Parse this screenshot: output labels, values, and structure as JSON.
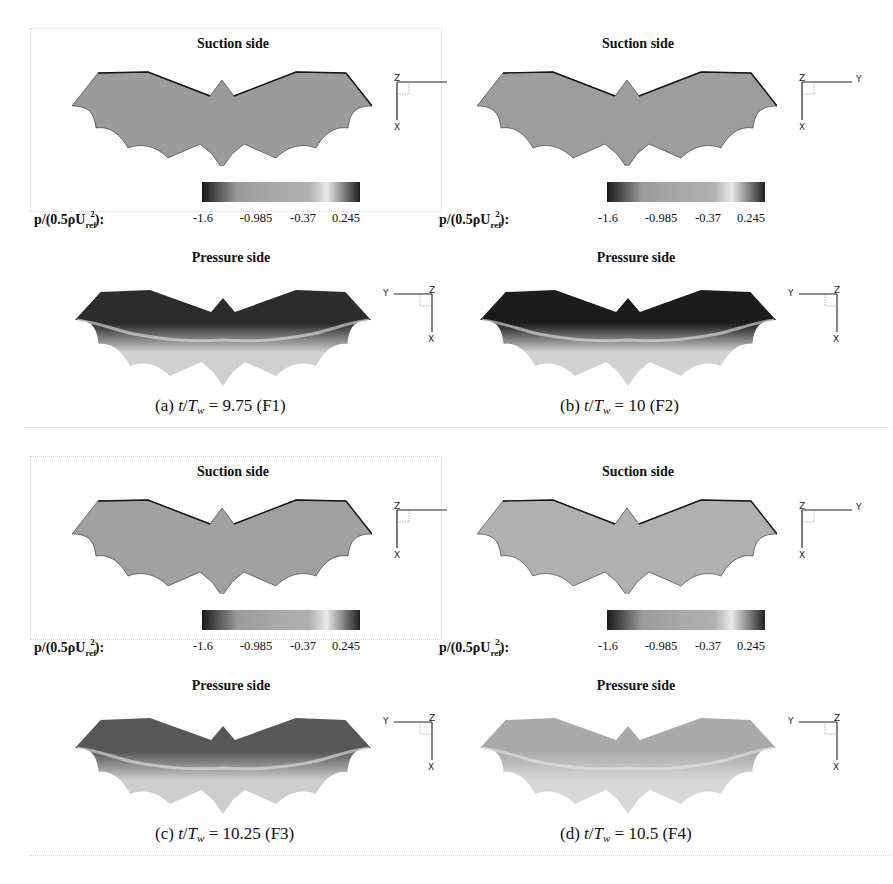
{
  "figure": {
    "colorbar": {
      "quantity_label": "p/(0.5ρU",
      "sub": "ref",
      "sup": "2",
      "suffix": "):",
      "ticks": [
        "-1.6",
        "-0.985",
        "-0.37",
        "0.245"
      ],
      "range": [
        -1.6,
        0.245
      ],
      "colors": [
        "#1a1a1a",
        "#9a9a9a",
        "#a8a8a8",
        "#b0b0b0",
        "#e8e8e8",
        "#202020"
      ]
    },
    "axes_triad": {
      "x": "X",
      "y": "Y",
      "z": "Z"
    },
    "panels": [
      {
        "id": "a",
        "suction_title": "Suction side",
        "pressure_title": "Pressure side",
        "caption_prefix": "(a) ",
        "caption_t": "t",
        "caption_slash": "/",
        "caption_T": "T",
        "caption_sub": "w",
        "caption_rest": " = 9.75 (F1)",
        "suction_fill": "#9b9b9b",
        "pressure_top": "#2c2c2c",
        "pressure_bottom": "#cfcfcf"
      },
      {
        "id": "b",
        "suction_title": "Suction side",
        "pressure_title": "Pressure side",
        "caption_prefix": "(b) ",
        "caption_t": "t",
        "caption_slash": "/",
        "caption_T": "T",
        "caption_sub": "w",
        "caption_rest": " = 10 (F2)",
        "suction_fill": "#9d9d9d",
        "pressure_top": "#1c1c1c",
        "pressure_bottom": "#d2d2d2"
      },
      {
        "id": "c",
        "suction_title": "Suction side",
        "pressure_title": "Pressure side",
        "caption_prefix": "(c) ",
        "caption_t": "t",
        "caption_slash": "/",
        "caption_T": "T",
        "caption_sub": "w",
        "caption_rest": " = 10.25 (F3)",
        "suction_fill": "#a0a0a0",
        "pressure_top": "#575757",
        "pressure_bottom": "#cdcdcd"
      },
      {
        "id": "d",
        "suction_title": "Suction side",
        "pressure_title": "Pressure side",
        "caption_prefix": "(d) ",
        "caption_t": "t",
        "caption_slash": "/",
        "caption_T": "T",
        "caption_sub": "w",
        "caption_rest": " = 10.5 (F4)",
        "suction_fill": "#b0b0b0",
        "pressure_top": "#a9a9a9",
        "pressure_bottom": "#d8d8d8"
      }
    ]
  }
}
